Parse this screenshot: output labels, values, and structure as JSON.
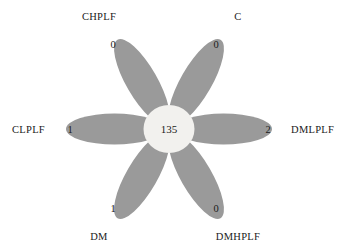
{
  "chart_data": {
    "type": "pie",
    "title": "",
    "subtitle": "",
    "xlabel": "",
    "ylabel": "",
    "legend": "none",
    "grid": false,
    "core": {
      "label": "core",
      "value": "135"
    },
    "categories": [
      "CHPLF",
      "C",
      "DMLPLF",
      "DMHPLF",
      "DM",
      "CLPLF"
    ],
    "values": [
      0,
      0,
      2,
      0,
      1,
      1
    ],
    "petals": [
      {
        "id": "petal-chplf",
        "label": "CHPLF",
        "value": "0",
        "angle_deg": -30,
        "label_x": 99,
        "label_y": 20,
        "label_anchor": "middle",
        "value_x": 113,
        "value_y": 48
      },
      {
        "id": "petal-c",
        "label": "C",
        "value": "0",
        "angle_deg": 30,
        "label_x": 238,
        "label_y": 20,
        "label_anchor": "middle",
        "value_x": 216,
        "value_y": 48
      },
      {
        "id": "petal-dmlplf",
        "label": "DMLPLF",
        "value": "2",
        "angle_deg": 90,
        "label_x": 291,
        "label_y": 133,
        "label_anchor": "start",
        "value_x": 268,
        "value_y": 133
      },
      {
        "id": "petal-dmhplf",
        "label": "DMHPLF",
        "value": "0",
        "angle_deg": 150,
        "label_x": 238,
        "label_y": 240,
        "label_anchor": "middle",
        "value_x": 216,
        "value_y": 212
      },
      {
        "id": "petal-dm",
        "label": "DM",
        "value": "1",
        "angle_deg": 210,
        "label_x": 99,
        "label_y": 240,
        "label_anchor": "middle",
        "value_x": 113,
        "value_y": 212
      },
      {
        "id": "petal-clplf",
        "label": "CLPLF",
        "value": "1",
        "angle_deg": 270,
        "label_x": 45,
        "label_y": 133,
        "label_anchor": "end",
        "value_x": 70,
        "value_y": 133
      }
    ],
    "colors": {
      "petal_fill": "#9a9a9a",
      "core_fill": "#f2f1ee",
      "background": "#ffffff",
      "text": "#1a1a1a"
    },
    "geometry": {
      "center_x": 169,
      "center_y": 129,
      "core_radius": 25,
      "petal_length": 97,
      "petal_width": 31
    }
  }
}
